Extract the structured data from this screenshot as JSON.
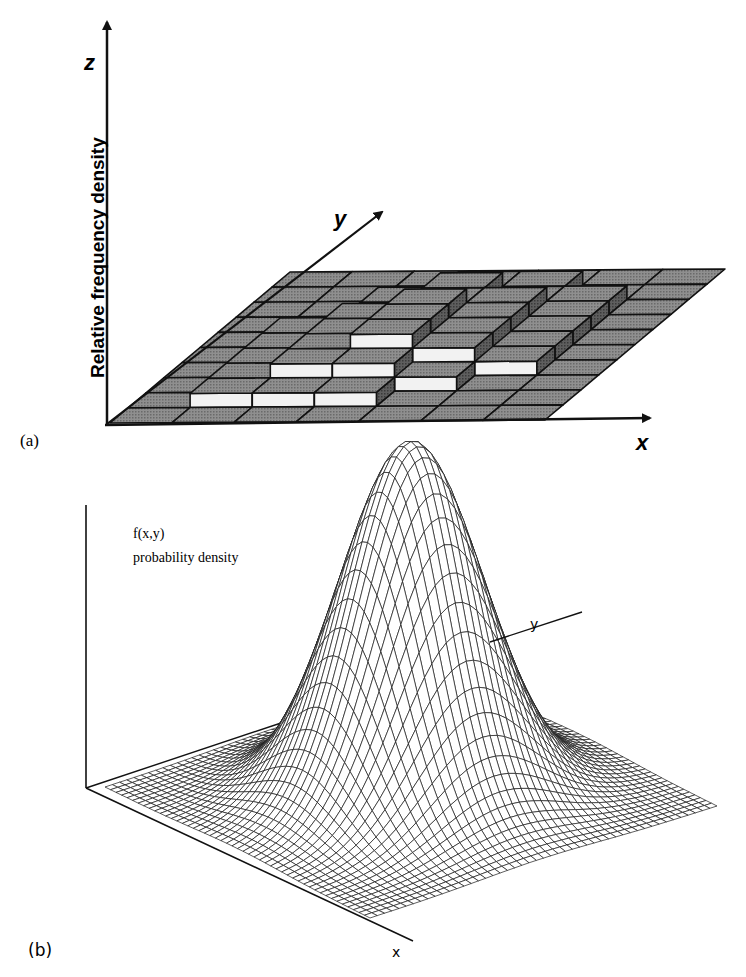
{
  "figure_a": {
    "panel_label": "(a)",
    "z_axis_label": "z",
    "y_axis_label": "y",
    "x_axis_label": "x",
    "vertical_title": "Relative frequency density"
  },
  "figure_b": {
    "panel_label": "(b)",
    "title_line1": "f(x,y)",
    "title_line2": "probability density",
    "y_axis_label": "y",
    "x_axis_label": "x"
  },
  "colors": {
    "ink": "#111111",
    "cell_top": "#8a8a8a",
    "cell_side": "#5a5a5a",
    "cell_front": "#f2f2f2",
    "paper": "#ffffff"
  },
  "chart_data": [
    {
      "type": "heatmap",
      "subtype": "3d_bivariate_histogram",
      "title": "",
      "xlabel": "x",
      "ylabel": "y",
      "zlabel": "z (Relative frequency density)",
      "grid": false,
      "note": "Relative frequency density bars on a 7 (x) x 10 (y) grid; heights are relative units read from the block steps",
      "x_bins": 7,
      "y_bins": 10,
      "heights": [
        [
          0,
          0,
          0,
          0,
          0,
          0,
          0
        ],
        [
          0,
          1,
          1,
          1,
          0,
          0,
          0
        ],
        [
          0,
          1,
          2,
          2,
          1,
          0,
          0
        ],
        [
          0,
          1,
          2,
          3,
          2,
          1,
          0
        ],
        [
          0,
          1,
          2,
          3,
          2,
          1,
          0
        ],
        [
          0,
          1,
          2,
          3,
          2,
          1,
          0
        ],
        [
          0,
          0,
          1,
          2,
          2,
          1,
          0
        ],
        [
          0,
          0,
          1,
          2,
          1,
          1,
          0
        ],
        [
          0,
          0,
          0,
          1,
          1,
          0,
          0
        ],
        [
          0,
          0,
          0,
          0,
          0,
          0,
          0
        ]
      ]
    },
    {
      "type": "area",
      "subtype": "3d_surface_bivariate_normal",
      "title": "f(x,y) probability density",
      "xlabel": "x",
      "ylabel": "y",
      "zlabel": "f(x,y)",
      "grid": false,
      "mesh_size": 48,
      "mean": [
        0,
        0
      ],
      "std": [
        1,
        1
      ],
      "correlation": 0,
      "range": [
        -3,
        3
      ]
    }
  ]
}
